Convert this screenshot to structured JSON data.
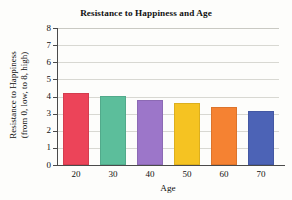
{
  "chart_data": {
    "type": "bar",
    "title": "Resistance to Happiness and Age",
    "xlabel": "Age",
    "ylabel": "Resistance to Happiness (from 0, low, to 8, high)",
    "ylabel_line1": "Resistance to Happiness",
    "ylabel_line2": "(from 0, low, to 8, high)",
    "categories": [
      "20",
      "30",
      "40",
      "50",
      "60",
      "70"
    ],
    "values": [
      4.2,
      4.0,
      3.8,
      3.6,
      3.4,
      3.15
    ],
    "ylim": [
      0,
      8
    ],
    "yticks": [
      "8",
      "7",
      "6",
      "5",
      "4",
      "3",
      "2",
      "1",
      "0"
    ],
    "ytick_values": [
      8,
      7,
      6,
      5,
      4,
      3,
      2,
      1,
      0
    ],
    "grid": true,
    "legend": "none",
    "bar_colors": [
      "#EC4459",
      "#5CBE9B",
      "#9C76C9",
      "#F5C322",
      "#F58232",
      "#4C63B6"
    ]
  },
  "figure": {
    "background_color": "#FDFDFB",
    "axis_color": "#4A4A4A",
    "gridline_color": "#D8D8D2",
    "text_color": "#111111"
  }
}
